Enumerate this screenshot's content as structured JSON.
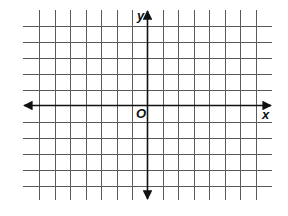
{
  "diagram": {
    "type": "coordinate-plane",
    "x_axis_label": "x",
    "y_axis_label": "y",
    "origin_label": "O",
    "grid": {
      "columns_left_of_y_axis": 7,
      "columns_right_of_y_axis": 7,
      "rows_above_x_axis": 5,
      "rows_below_x_axis": 5
    },
    "axes_have_arrows": true,
    "colors": {
      "grid": "#5a5a5a",
      "axis": "#111111",
      "background": "#ffffff"
    }
  }
}
